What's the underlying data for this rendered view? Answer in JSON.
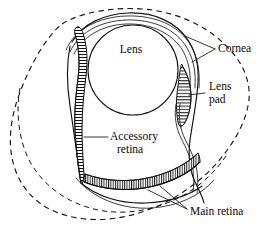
{
  "figure": {
    "kind": "anatomical-diagram",
    "background_color": "#ffffff",
    "ink_color": "#111111"
  },
  "labels": {
    "lens": "Lens",
    "cornea": "Cornea",
    "lens_pad_line1": "Lens",
    "lens_pad_line2": "pad",
    "accessory_retina_line1": "Accessory",
    "accessory_retina_line2": "retina",
    "main_retina": "Main retina"
  },
  "structures": [
    {
      "id": "outer-boundary",
      "name": "outer dashed boundary",
      "style": "dashed"
    },
    {
      "id": "inner-boundary",
      "name": "inner dashed boundary",
      "style": "dashed"
    },
    {
      "id": "eye-chamber",
      "name": "eye chamber wall",
      "style": "solid"
    },
    {
      "id": "cornea",
      "name": "cornea",
      "style": "thin double line"
    },
    {
      "id": "lens",
      "name": "lens",
      "style": "circle outline"
    },
    {
      "id": "lens-pad",
      "name": "lens pad",
      "style": "hatched spindle"
    },
    {
      "id": "accessory-retina",
      "name": "accessory retina",
      "style": "hatched vertical strip"
    },
    {
      "id": "main-retina",
      "name": "main retina",
      "style": "hatched arc band"
    }
  ]
}
